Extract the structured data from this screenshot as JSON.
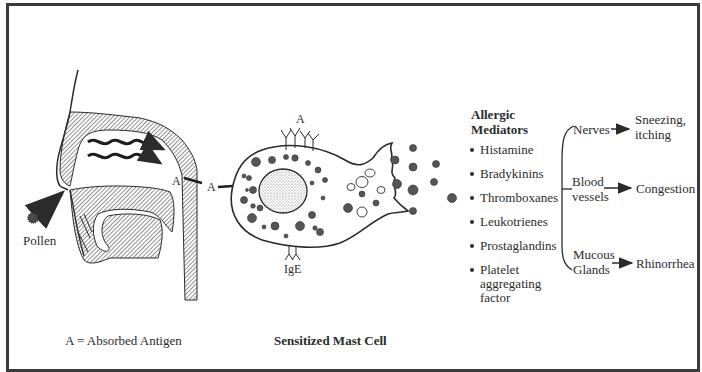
{
  "diagram": {
    "left_panel": {
      "pollen_label": "Pollen",
      "antigen_marker": "A",
      "legend": "A = Absorbed Antigen"
    },
    "center_panel": {
      "antigen_marker_left": "A",
      "antigen_marker_top": "A",
      "receptor_label": "IgE",
      "caption": "Sensitized Mast Cell"
    },
    "mediators": {
      "heading_line1": "Allergic",
      "heading_line2": "Mediators",
      "items": [
        "Histamine",
        "Bradykinins",
        "Thromboxanes",
        "Leukotrienes",
        "Prostaglandins",
        "Platelet aggregating factor"
      ]
    },
    "targets": [
      {
        "target_line1": "Nerves",
        "target_line2": "",
        "effect_line1": "Sneezing,",
        "effect_line2": "itching"
      },
      {
        "target_line1": "Blood",
        "target_line2": "vessels",
        "effect_line1": "Congestion",
        "effect_line2": ""
      },
      {
        "target_line1": "Mucous",
        "target_line2": "Glands",
        "effect_line1": "Rhinorrhea",
        "effect_line2": ""
      }
    ],
    "colors": {
      "ink": "#2b2b2b",
      "hatch": "#4a4a4a",
      "frame": "#3a3a3a",
      "background": "#ffffff"
    }
  }
}
